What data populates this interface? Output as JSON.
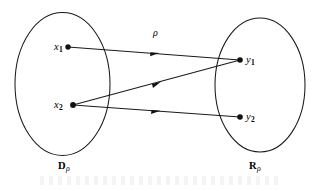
{
  "figure": {
    "type": "relation-mapping-diagram",
    "domain_set": {
      "label": "D",
      "subscript": "ρ",
      "elements": [
        {
          "label": "x",
          "subscript": "1"
        },
        {
          "label": "x",
          "subscript": "2"
        }
      ]
    },
    "range_set": {
      "label": "R",
      "subscript": "ρ",
      "elements": [
        {
          "label": "y",
          "subscript": "1"
        },
        {
          "label": "y",
          "subscript": "2"
        }
      ]
    },
    "relation_label": "ρ",
    "mappings": [
      {
        "from": "x1",
        "to": "y1"
      },
      {
        "from": "x2",
        "to": "y1"
      },
      {
        "from": "x2",
        "to": "y2"
      }
    ],
    "colors": {
      "ink": "#1a1a1a",
      "background": "#ffffff"
    }
  }
}
